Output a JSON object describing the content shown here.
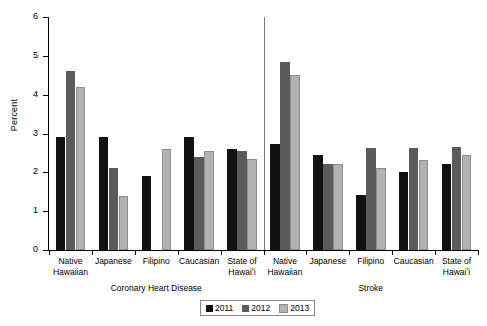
{
  "chart_data": {
    "type": "bar",
    "title": "",
    "xlabel": "",
    "ylabel": "Percent",
    "ylim": [
      0,
      6
    ],
    "ytick_values": [
      0,
      1,
      2,
      3,
      4,
      5,
      6
    ],
    "ytick_labels": [
      "0",
      "1",
      "2",
      "3",
      "4",
      "5",
      "6"
    ],
    "grid": false,
    "legend_position": "bottom-center",
    "legend_entries": [
      "2011",
      "2012",
      "2013"
    ],
    "series_colors": {
      "2011": "#111111",
      "2012": "#5b5b5b",
      "2013": "#b2b2b2"
    },
    "panels": [
      {
        "name": "Coronary Heart Disease",
        "categories": [
          "Native\nHawaiian",
          "Japanese",
          "Filipino",
          "Caucasian",
          "State of\nHawaiʻi"
        ],
        "series": [
          {
            "name": "2011",
            "values": [
              2.9,
              2.9,
              1.9,
              2.9,
              2.6
            ]
          },
          {
            "name": "2012",
            "values": [
              4.6,
              2.1,
              null,
              2.4,
              2.55
            ]
          },
          {
            "name": "2013",
            "values": [
              4.2,
              1.4,
              2.6,
              2.55,
              2.35
            ]
          }
        ]
      },
      {
        "name": "Stroke",
        "categories": [
          "Native\nHawaiian",
          "Japanese",
          "Filipino",
          "Caucasian",
          "State of\nHawaiʻi"
        ],
        "series": [
          {
            "name": "2011",
            "values": [
              2.72,
              2.45,
              1.42,
              2.02,
              2.22
            ]
          },
          {
            "name": "2012",
            "values": [
              4.83,
              2.22,
              2.62,
              2.62,
              2.65
            ]
          },
          {
            "name": "2013",
            "values": [
              4.5,
              2.22,
              2.12,
              2.33,
              2.45
            ]
          }
        ]
      }
    ]
  },
  "legend": {
    "items": [
      {
        "label": "2011",
        "color": "#111111"
      },
      {
        "label": "2012",
        "color": "#5b5b5b"
      },
      {
        "label": "2013",
        "color": "#b2b2b2"
      }
    ]
  }
}
